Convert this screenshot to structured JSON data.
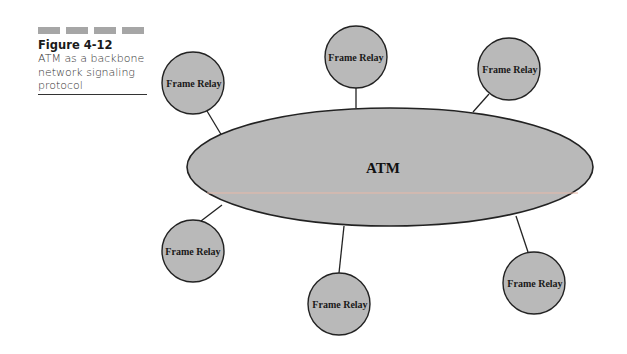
{
  "caption": {
    "dash_count": 4,
    "title": "Figure 4-12",
    "description_lines": [
      "ATM as a backbone",
      "network signaling",
      "protocol"
    ]
  },
  "diagram": {
    "colors": {
      "fill": "#b9b9b9",
      "stroke": "#222222",
      "artifact_line": "#e8b9a8"
    },
    "backbone": {
      "label": "ATM",
      "cx": 390,
      "cy": 167,
      "rx": 203,
      "ry": 59
    },
    "nodes": [
      {
        "label": "Frame Relay",
        "cx": 193,
        "cy": 83,
        "r": 31,
        "link": [
          [
            207,
            111
          ],
          [
            222,
            136
          ]
        ]
      },
      {
        "label": "Frame Relay",
        "cx": 356,
        "cy": 57,
        "r": 31,
        "link": [
          [
            356,
            88
          ],
          [
            356,
            108
          ]
        ]
      },
      {
        "label": "Frame Relay",
        "cx": 509,
        "cy": 69,
        "r": 31,
        "link": [
          [
            489,
            94
          ],
          [
            473,
            112
          ]
        ]
      },
      {
        "label": "Frame Relay",
        "cx": 193,
        "cy": 251,
        "r": 31,
        "link": [
          [
            201,
            221
          ],
          [
            222,
            205
          ]
        ]
      },
      {
        "label": "Frame Relay",
        "cx": 339,
        "cy": 304,
        "r": 31,
        "link": [
          [
            339,
            273
          ],
          [
            344,
            226
          ]
        ]
      },
      {
        "label": "Frame Relay",
        "cx": 534,
        "cy": 283,
        "r": 31,
        "link": [
          [
            528,
            252
          ],
          [
            516,
            216
          ]
        ]
      }
    ]
  }
}
